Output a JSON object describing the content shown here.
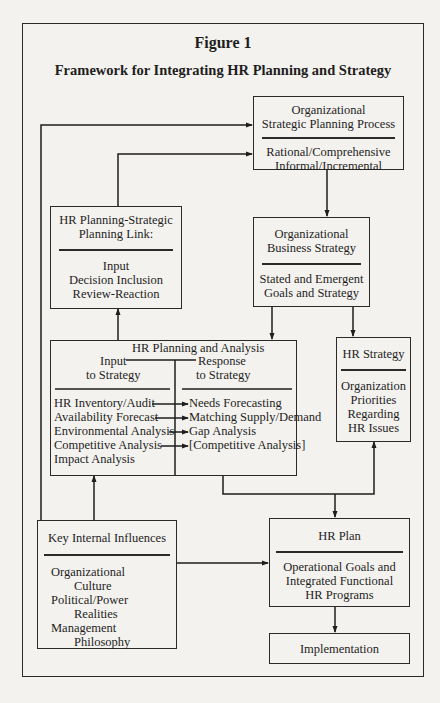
{
  "figure": {
    "label": "Figure 1",
    "title": "Framework for Integrating HR Planning and Strategy"
  },
  "boxes": {
    "org_strategic_planning": {
      "heading": [
        "Organizational",
        "Strategic Planning Process"
      ],
      "body": [
        "Rational/Comprehensive",
        "Informal/Incremental"
      ]
    },
    "hr_planning_strategic_link": {
      "heading": [
        "HR Planning-Strategic",
        "Planning Link:"
      ],
      "body": [
        "Input",
        "Decision Inclusion",
        "Review-Reaction"
      ]
    },
    "org_business_strategy": {
      "heading": [
        "Organizational",
        "Business Strategy"
      ],
      "body": [
        "Stated and Emergent",
        "Goals and Strategy"
      ]
    },
    "hr_planning_analysis": {
      "heading": "HR Planning and Analysis",
      "input_header": [
        "Input",
        "to Strategy"
      ],
      "response_header": [
        "Response",
        "to Strategy"
      ],
      "inputs": [
        "HR Inventory/Audit",
        "Availability Forecast",
        "Environmental Analysis",
        "Competitive Analysis",
        "Impact Analysis"
      ],
      "responses": [
        "Needs Forecasting",
        "Matching Supply/Demand",
        "Gap Analysis",
        "[Competitive Analysis]"
      ]
    },
    "hr_strategy": {
      "heading": "HR Strategy",
      "body": [
        "Organization",
        "Priorities",
        "Regarding",
        "HR Issues"
      ]
    },
    "key_internal_influences": {
      "heading": "Key Internal Influences",
      "body": [
        "Organizational",
        "Culture",
        "Political/Power",
        "Realities",
        "Management",
        "Philosophy"
      ]
    },
    "hr_plan": {
      "heading": "HR Plan",
      "body": [
        "Operational Goals and",
        "Integrated Functional",
        "HR Programs"
      ]
    },
    "implementation": {
      "heading": "Implementation"
    }
  }
}
